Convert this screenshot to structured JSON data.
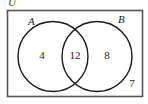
{
  "figure": {
    "type": "venn-diagram",
    "universal_set_label": "U",
    "sets": [
      {
        "label": "A",
        "only_count": "4"
      },
      {
        "label": "B",
        "only_count": "8"
      }
    ],
    "intersection_count": "12",
    "outside_count": "7",
    "colors": {
      "stroke": "#1a1a1a",
      "rectangle_border": "#555555",
      "background": "#ffffff",
      "text": "#1a1a1a"
    }
  }
}
